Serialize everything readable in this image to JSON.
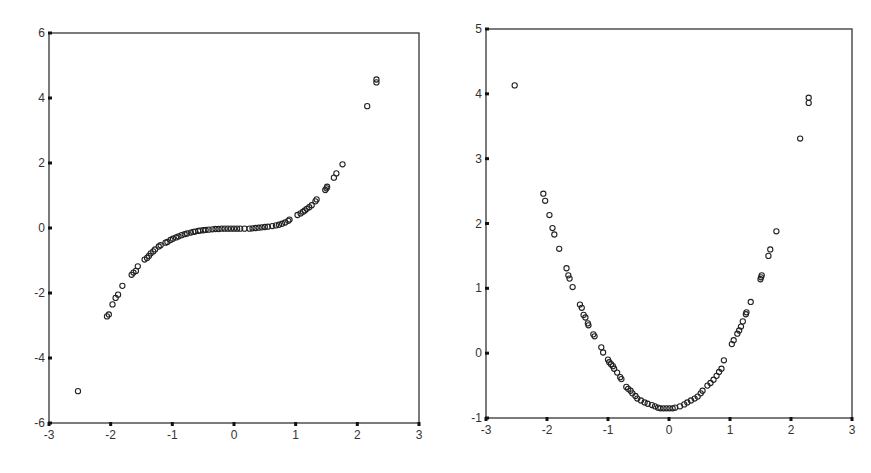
{
  "figure": {
    "top_text_clipped": "(text clipped at top edge)"
  },
  "chart_data": [
    {
      "type": "scatter",
      "title": "",
      "xlabel": "",
      "ylabel": "",
      "xlim": [
        -3,
        3
      ],
      "ylim": [
        -6,
        6
      ],
      "xticks": [
        -3,
        -2,
        -1,
        0,
        1,
        2,
        3
      ],
      "yticks": [
        -6,
        -4,
        -2,
        0,
        2,
        4,
        6
      ],
      "grid": false,
      "legend": null,
      "marker": "open-circle",
      "description": "Cubic-shaped relationship (S-curve through origin)",
      "points": [
        [
          -2.53,
          -5.02
        ],
        [
          -2.06,
          -2.72
        ],
        [
          -2.03,
          -2.66
        ],
        [
          -1.97,
          -2.35
        ],
        [
          -1.92,
          -2.15
        ],
        [
          -1.88,
          -2.05
        ],
        [
          -1.81,
          -1.78
        ],
        [
          -1.66,
          -1.44
        ],
        [
          -1.63,
          -1.37
        ],
        [
          -1.59,
          -1.32
        ],
        [
          -1.56,
          -1.18
        ],
        [
          -1.45,
          -0.97
        ],
        [
          -1.41,
          -0.92
        ],
        [
          -1.38,
          -0.86
        ],
        [
          -1.35,
          -0.78
        ],
        [
          -1.31,
          -0.72
        ],
        [
          -1.28,
          -0.66
        ],
        [
          -1.22,
          -0.57
        ],
        [
          -1.19,
          -0.53
        ],
        [
          -1.11,
          -0.45
        ],
        [
          -1.08,
          -0.43
        ],
        [
          -1.03,
          -0.37
        ],
        [
          -0.99,
          -0.33
        ],
        [
          -0.94,
          -0.29
        ],
        [
          -0.9,
          -0.26
        ],
        [
          -0.85,
          -0.22
        ],
        [
          -0.8,
          -0.19
        ],
        [
          -0.76,
          -0.17
        ],
        [
          -0.7,
          -0.14
        ],
        [
          -0.66,
          -0.12
        ],
        [
          -0.63,
          -0.11
        ],
        [
          -0.58,
          -0.09
        ],
        [
          -0.55,
          -0.08
        ],
        [
          -0.5,
          -0.07
        ],
        [
          -0.46,
          -0.06
        ],
        [
          -0.41,
          -0.05
        ],
        [
          -0.35,
          -0.04
        ],
        [
          -0.3,
          -0.03
        ],
        [
          -0.25,
          -0.03
        ],
        [
          -0.2,
          -0.02
        ],
        [
          -0.15,
          -0.02
        ],
        [
          -0.1,
          -0.02
        ],
        [
          -0.05,
          -0.02
        ],
        [
          0.0,
          -0.02
        ],
        [
          0.05,
          -0.02
        ],
        [
          0.1,
          -0.02
        ],
        [
          0.17,
          -0.02
        ],
        [
          0.25,
          -0.02
        ],
        [
          0.3,
          -0.01
        ],
        [
          0.35,
          0.0
        ],
        [
          0.4,
          0.01
        ],
        [
          0.45,
          0.02
        ],
        [
          0.5,
          0.03
        ],
        [
          0.55,
          0.04
        ],
        [
          0.62,
          0.06
        ],
        [
          0.68,
          0.08
        ],
        [
          0.73,
          0.1
        ],
        [
          0.78,
          0.13
        ],
        [
          0.83,
          0.17
        ],
        [
          0.88,
          0.22
        ],
        [
          0.9,
          0.26
        ],
        [
          1.03,
          0.4
        ],
        [
          1.08,
          0.45
        ],
        [
          1.12,
          0.5
        ],
        [
          1.15,
          0.54
        ],
        [
          1.18,
          0.59
        ],
        [
          1.22,
          0.64
        ],
        [
          1.26,
          0.7
        ],
        [
          1.32,
          0.82
        ],
        [
          1.34,
          0.88
        ],
        [
          1.48,
          1.17
        ],
        [
          1.5,
          1.22
        ],
        [
          1.51,
          1.27
        ],
        [
          1.62,
          1.55
        ],
        [
          1.66,
          1.68
        ],
        [
          1.76,
          1.96
        ],
        [
          2.16,
          3.75
        ],
        [
          2.31,
          4.48
        ],
        [
          2.31,
          4.57
        ]
      ]
    },
    {
      "type": "scatter",
      "title": "",
      "xlabel": "",
      "ylabel": "",
      "xlim": [
        -3,
        3
      ],
      "ylim": [
        -1,
        5
      ],
      "xticks": [
        -3,
        -2,
        -1,
        0,
        1,
        2,
        3
      ],
      "yticks": [
        -1,
        0,
        1,
        2,
        3,
        4,
        5
      ],
      "grid": false,
      "legend": null,
      "marker": "open-circle",
      "description": "Quadratic-shaped relationship (U-curve with minimum near x=0, y≈-0.85)",
      "points": [
        [
          -2.53,
          4.13
        ],
        [
          -2.06,
          2.46
        ],
        [
          -2.03,
          2.35
        ],
        [
          -1.96,
          2.13
        ],
        [
          -1.91,
          1.93
        ],
        [
          -1.88,
          1.83
        ],
        [
          -1.8,
          1.61
        ],
        [
          -1.68,
          1.31
        ],
        [
          -1.65,
          1.2
        ],
        [
          -1.63,
          1.15
        ],
        [
          -1.58,
          1.02
        ],
        [
          -1.46,
          0.75
        ],
        [
          -1.43,
          0.7
        ],
        [
          -1.4,
          0.59
        ],
        [
          -1.37,
          0.55
        ],
        [
          -1.33,
          0.46
        ],
        [
          -1.32,
          0.43
        ],
        [
          -1.24,
          0.29
        ],
        [
          -1.22,
          0.26
        ],
        [
          -1.11,
          0.09
        ],
        [
          -1.08,
          0.01
        ],
        [
          -1.0,
          -0.1
        ],
        [
          -0.98,
          -0.14
        ],
        [
          -0.95,
          -0.17
        ],
        [
          -0.92,
          -0.2
        ],
        [
          -0.9,
          -0.24
        ],
        [
          -0.85,
          -0.3
        ],
        [
          -0.8,
          -0.37
        ],
        [
          -0.78,
          -0.4
        ],
        [
          -0.7,
          -0.52
        ],
        [
          -0.67,
          -0.55
        ],
        [
          -0.63,
          -0.58
        ],
        [
          -0.6,
          -0.62
        ],
        [
          -0.55,
          -0.66
        ],
        [
          -0.52,
          -0.7
        ],
        [
          -0.46,
          -0.73
        ],
        [
          -0.4,
          -0.76
        ],
        [
          -0.35,
          -0.78
        ],
        [
          -0.28,
          -0.8
        ],
        [
          -0.23,
          -0.82
        ],
        [
          -0.18,
          -0.84
        ],
        [
          -0.14,
          -0.85
        ],
        [
          -0.09,
          -0.85
        ],
        [
          -0.04,
          -0.85
        ],
        [
          0.01,
          -0.85
        ],
        [
          0.06,
          -0.85
        ],
        [
          0.1,
          -0.84
        ],
        [
          0.18,
          -0.82
        ],
        [
          0.25,
          -0.79
        ],
        [
          0.3,
          -0.76
        ],
        [
          0.36,
          -0.73
        ],
        [
          0.42,
          -0.7
        ],
        [
          0.47,
          -0.67
        ],
        [
          0.52,
          -0.62
        ],
        [
          0.55,
          -0.58
        ],
        [
          0.63,
          -0.5
        ],
        [
          0.68,
          -0.46
        ],
        [
          0.73,
          -0.41
        ],
        [
          0.78,
          -0.35
        ],
        [
          0.82,
          -0.29
        ],
        [
          0.86,
          -0.24
        ],
        [
          0.9,
          -0.11
        ],
        [
          1.03,
          0.14
        ],
        [
          1.06,
          0.2
        ],
        [
          1.12,
          0.3
        ],
        [
          1.15,
          0.35
        ],
        [
          1.18,
          0.41
        ],
        [
          1.21,
          0.49
        ],
        [
          1.26,
          0.6
        ],
        [
          1.27,
          0.63
        ],
        [
          1.34,
          0.79
        ],
        [
          1.5,
          1.14
        ],
        [
          1.51,
          1.17
        ],
        [
          1.52,
          1.2
        ],
        [
          1.63,
          1.5
        ],
        [
          1.66,
          1.6
        ],
        [
          1.76,
          1.88
        ],
        [
          2.15,
          3.31
        ],
        [
          2.29,
          3.86
        ],
        [
          2.29,
          3.94
        ]
      ]
    }
  ]
}
